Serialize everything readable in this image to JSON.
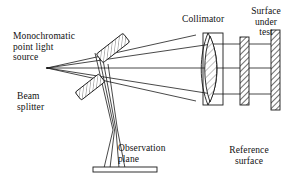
{
  "figure": {
    "type": "optical-interferometer-schematic",
    "width": 293,
    "height": 187,
    "background_color": "#ffffff",
    "line_color": "#1a1a1a",
    "hatch_color": "#555555"
  },
  "labels": {
    "source": "Monochromatic\npoint light\nsource",
    "beam_splitter": "Beam\nsplitter",
    "observation_plane": "Observation\nplane",
    "collimator": "Collimator",
    "reference_surface": "Reference\nsurface",
    "surface_under_test": "Surface\nunder\ntest"
  },
  "components": [
    {
      "name": "point-light-source",
      "label": "Monochromatic point light source",
      "kind": "point",
      "x": 47,
      "y": 68
    },
    {
      "name": "beam-splitter-upper",
      "label": "Beam splitter",
      "kind": "tilted-plate",
      "angle_deg": -38
    },
    {
      "name": "beam-splitter-lower",
      "label": "Beam splitter",
      "kind": "tilted-plate",
      "angle_deg": -38
    },
    {
      "name": "collimator-lens",
      "label": "Collimator",
      "kind": "biconvex-lens-in-mount"
    },
    {
      "name": "reference-surface",
      "label": "Reference surface",
      "kind": "hatched-plate"
    },
    {
      "name": "surface-under-test",
      "label": "Surface under test",
      "kind": "hatched-plate"
    },
    {
      "name": "observation-plane",
      "label": "Observation plane",
      "kind": "horizontal-plate"
    }
  ]
}
